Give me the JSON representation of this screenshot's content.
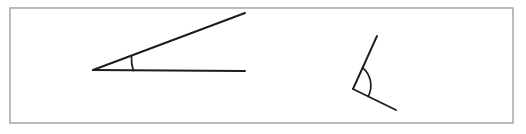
{
  "figure": {
    "background_color": "#ffffff",
    "frame": {
      "name": "diagram-border",
      "x": 10,
      "y": 8,
      "width": 503,
      "height": 115,
      "stroke_color": "#8f8f8f",
      "stroke_width": 1.2
    },
    "line_color": "#1d1d1d",
    "line_width": 1.9,
    "shapes": [
      {
        "name": "acute-angle",
        "label": "left acute angle",
        "vertex": {
          "x": 93,
          "y": 70
        },
        "rays": [
          {
            "name": "acute-angle-horizontal-ray",
            "from": {
              "x": 93,
              "y": 70
            },
            "to": {
              "x": 245,
              "y": 71
            }
          },
          {
            "name": "acute-angle-upper-ray",
            "from": {
              "x": 93,
              "y": 70
            },
            "to": {
              "x": 245,
              "y": 13
            }
          }
        ],
        "arc": {
          "name": "acute-angle-arc",
          "path": "M 131.5 56.3 A 40 40 0 0 0 133.3 70.6"
        }
      },
      {
        "name": "obtuse-angle",
        "label": "right obtuse angle",
        "vertex": {
          "x": 353,
          "y": 89
        },
        "rays": [
          {
            "name": "obtuse-angle-upper-ray",
            "from": {
              "x": 353,
              "y": 89
            },
            "to": {
              "x": 377,
              "y": 36
            }
          },
          {
            "name": "obtuse-angle-lower-ray",
            "from": {
              "x": 353,
              "y": 89
            },
            "to": {
              "x": 396,
              "y": 110
            }
          }
        ],
        "arc": {
          "name": "obtuse-angle-arc",
          "path": "M 362.6 67.6 A 23.5 23.5 0 0 1 368.2 96.4"
        }
      }
    ]
  }
}
